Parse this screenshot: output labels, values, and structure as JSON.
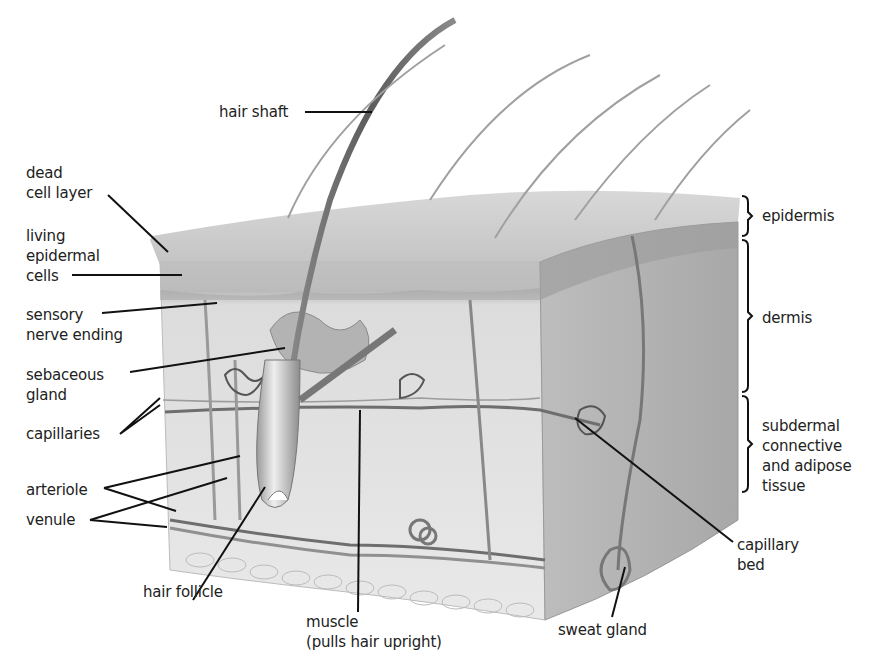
{
  "diagram": {
    "type": "anatomical-illustration",
    "labels": {
      "hair_shaft": "hair shaft",
      "dead_cell_layer": "dead\ncell layer",
      "living_epidermal_cells": "living\nepidermal\ncells",
      "sensory_nerve_ending": "sensory\nnerve ending",
      "sebaceous_gland": "sebaceous\ngland",
      "capillaries": "capillaries",
      "arteriole": "arteriole",
      "venule": "venule",
      "hair_follicle": "hair follicle",
      "muscle": "muscle\n(pulls hair upright)",
      "sweat_gland": "sweat gland",
      "capillary_bed": "capillary\nbed",
      "epidermis": "epidermis",
      "dermis": "dermis",
      "subdermal": "subdermal\nconnective\nand adipose\ntissue"
    },
    "layers": [
      "epidermis",
      "dermis",
      "subdermal connective and adipose tissue"
    ],
    "colors": {
      "label_text": "#222222",
      "leader_line": "#111111",
      "epidermis_top": "#c9c9c9",
      "dermis": "#d6d6d6",
      "side_face": "#a9a9a9",
      "vessel": "#6e6e6e"
    }
  }
}
